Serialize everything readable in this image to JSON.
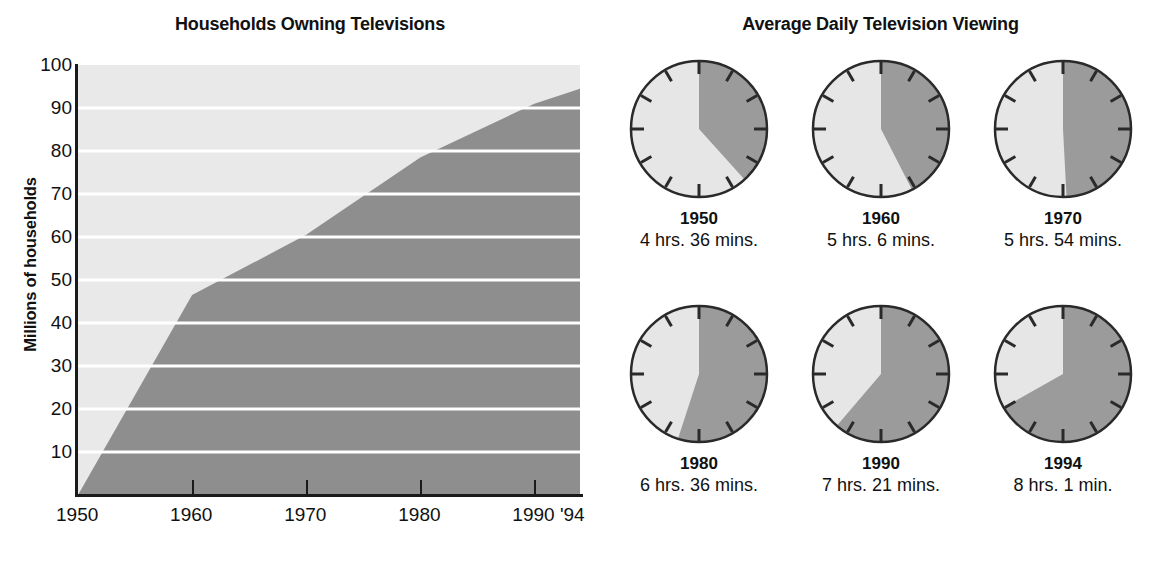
{
  "chart_data": [
    {
      "type": "area",
      "title": "Households Owning Televisions",
      "xlabel": "",
      "ylabel": "Millions of households",
      "ylim": [
        0,
        100
      ],
      "xlim": [
        1950,
        1994
      ],
      "grid": true,
      "legend": null,
      "yticks": [
        100,
        90,
        80,
        70,
        60,
        50,
        40,
        30,
        20,
        10
      ],
      "xticks": [
        "1950",
        "1960",
        "1970",
        "1980",
        "1990",
        "'94"
      ],
      "xtick_values": [
        1950,
        1960,
        1970,
        1980,
        1990,
        1994
      ],
      "x": [
        1950,
        1960,
        1970,
        1980,
        1990,
        1994
      ],
      "values": [
        0,
        46.5,
        60.5,
        78.5,
        91.0,
        94.5
      ],
      "series": [
        {
          "name": "Households owning televisions",
          "values": [
            0,
            46.5,
            60.5,
            78.5,
            91.0,
            94.5
          ]
        }
      ],
      "colors": {
        "area_fill": "#8e8e8e",
        "plot_background": "#e9e9e9",
        "gridline": "#ffffff",
        "axis": "#1a1a1a"
      }
    },
    {
      "type": "pie",
      "title": "Average Daily Television Viewing",
      "subtitle": "Clock faces showing hours viewed per day out of 12",
      "categories": [
        "1950",
        "1960",
        "1970",
        "1980",
        "1990",
        "1994"
      ],
      "values": [
        4.6,
        5.1,
        5.9,
        6.6,
        7.35,
        8.0167
      ],
      "unit": "hours per day",
      "labels": [
        "4 hrs. 36 mins.",
        "5 hrs. 6 mins.",
        "5 hrs. 54 mins.",
        "6 hrs. 36 mins.",
        "7 hrs. 21 mins.",
        "8 hrs. 1 min."
      ],
      "colors": {
        "wedge": "#9b9b9b",
        "face": "#e6e6e6",
        "outline": "#2a2a2a"
      }
    }
  ],
  "left": {
    "title": "Households Owning Televisions",
    "ylabel": "Millions of households",
    "yticks": [
      "100",
      "90",
      "80",
      "70",
      "60",
      "50",
      "40",
      "30",
      "20",
      "10"
    ],
    "xticks": [
      "1950",
      "1960",
      "1970",
      "1980",
      "1990 '94"
    ]
  },
  "right": {
    "title": "Average Daily Television Viewing",
    "clocks": [
      {
        "year": "1950",
        "time": "4 hrs. 36 mins.",
        "hours": 4.6
      },
      {
        "year": "1960",
        "time": "5 hrs. 6 mins.",
        "hours": 5.1
      },
      {
        "year": "1970",
        "time": "5 hrs. 54 mins.",
        "hours": 5.9
      },
      {
        "year": "1980",
        "time": "6 hrs. 36 mins.",
        "hours": 6.6
      },
      {
        "year": "1990",
        "time": "7 hrs. 21 mins.",
        "hours": 7.35
      },
      {
        "year": "1994",
        "time": "8 hrs. 1 min.",
        "hours": 8.0167
      }
    ]
  }
}
